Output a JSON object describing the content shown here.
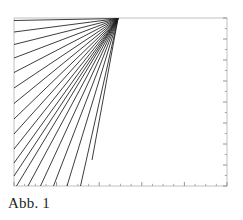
{
  "figure": {
    "caption": "Abb. 1",
    "background_color": "#ffffff",
    "ink_color": "#1a1a1a",
    "axis_color": "#b9b9b9",
    "tick_color": "#8a8a8a"
  },
  "chart_data": {
    "type": "line",
    "title": "",
    "subtitle": "",
    "xlabel": "",
    "ylabel": "",
    "grid": false,
    "legend": null,
    "annotations": [],
    "axes": {
      "frame_left_px": 14,
      "frame_top_px": 18,
      "frame_right_px": 227,
      "frame_bottom_px": 186,
      "top_spine": true,
      "left_spine": true,
      "right_spine": true,
      "bottom_spine": true,
      "xlim": [
        0,
        10
      ],
      "ylim": [
        0,
        8
      ],
      "x_tick_count": 21,
      "y_tick_count": 17,
      "x_ticklabels": [],
      "y_ticklabels": [],
      "tick_side": "inside-right-and-bottom"
    },
    "apex": {
      "x_px": 118.0,
      "y_px": 18.5
    },
    "rays": [
      {
        "id": 1,
        "x2_px": 14.0,
        "y2_px": 20.5
      },
      {
        "id": 2,
        "x2_px": 14.0,
        "y2_px": 32.0
      },
      {
        "id": 3,
        "x2_px": 14.0,
        "y2_px": 44.5
      },
      {
        "id": 4,
        "x2_px": 14.0,
        "y2_px": 58.0
      },
      {
        "id": 5,
        "x2_px": 14.0,
        "y2_px": 72.5
      },
      {
        "id": 6,
        "x2_px": 14.0,
        "y2_px": 88.0
      },
      {
        "id": 7,
        "x2_px": 14.0,
        "y2_px": 103.5
      },
      {
        "id": 8,
        "x2_px": 14.0,
        "y2_px": 119.0
      },
      {
        "id": 9,
        "x2_px": 14.0,
        "y2_px": 134.0
      },
      {
        "id": 10,
        "x2_px": 14.0,
        "y2_px": 149.0
      },
      {
        "id": 11,
        "x2_px": 14.0,
        "y2_px": 163.0
      },
      {
        "id": 12,
        "x2_px": 14.0,
        "y2_px": 176.0
      },
      {
        "id": 13,
        "x2_px": 16.5,
        "y2_px": 186.0
      },
      {
        "id": 14,
        "x2_px": 28.0,
        "y2_px": 186.0
      },
      {
        "id": 15,
        "x2_px": 40.5,
        "y2_px": 186.0
      },
      {
        "id": 16,
        "x2_px": 53.5,
        "y2_px": 186.0
      },
      {
        "id": 17,
        "x2_px": 67.0,
        "y2_px": 186.0
      },
      {
        "id": 18,
        "x2_px": 80.5,
        "y2_px": 186.0
      },
      {
        "id": 19,
        "x2_px": 92.0,
        "y2_px": 160.0
      }
    ],
    "ray_count": 19
  }
}
